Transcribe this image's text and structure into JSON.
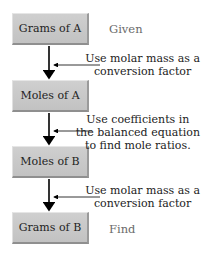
{
  "boxes": [
    {
      "label": "Grams of A"
    },
    {
      "label": "Moles of A"
    },
    {
      "label": "Moles of B"
    },
    {
      "label": "Grams of B"
    }
  ],
  "side_labels": {
    "given": "Given",
    "find": "Find"
  },
  "notes": [
    {
      "lines": [
        "Use molar mass as a",
        "conversion factor"
      ]
    },
    {
      "lines": [
        "Use coefficients in",
        "the balanced equation",
        "to find mole ratios."
      ]
    },
    {
      "lines": [
        "Use molar mass as a",
        "conversion factor"
      ]
    }
  ],
  "colors": {
    "box_fill": "#c8c8c8",
    "arrow": "#000000",
    "side_label": "#6a6a6a"
  }
}
